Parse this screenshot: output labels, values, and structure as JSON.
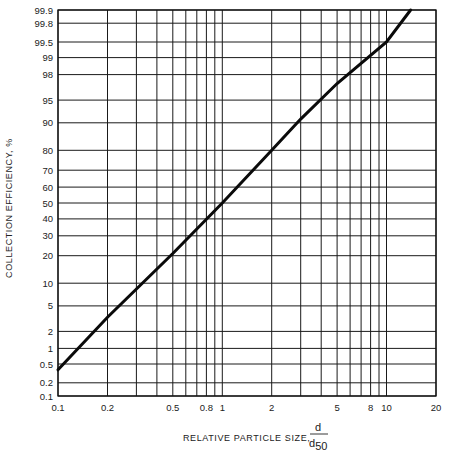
{
  "chart_data": {
    "type": "line",
    "title": "",
    "xlabel": "RELATIVE PARTICLE SIZE, d/d50",
    "xlabel_main": "RELATIVE PARTICLE SIZE,",
    "xlabel_frac_num": "d",
    "xlabel_frac_den": "d",
    "xlabel_frac_den_sub": "50",
    "ylabel": "COLLECTION EFFICIENCY, %",
    "x_scale": "log",
    "y_scale": "probability",
    "xlim": [
      0.1,
      20
    ],
    "ylim": [
      0.1,
      99.9
    ],
    "grid": true,
    "legend": null,
    "x_ticks": [
      0.1,
      0.2,
      0.3,
      0.4,
      0.5,
      0.6,
      0.7,
      0.8,
      0.9,
      1,
      2,
      3,
      4,
      5,
      6,
      7,
      8,
      9,
      10,
      20
    ],
    "x_tick_labels": [
      {
        "value": 0.1,
        "label": "0.1"
      },
      {
        "value": 0.2,
        "label": "0.2"
      },
      {
        "value": 0.5,
        "label": "0.5"
      },
      {
        "value": 0.8,
        "label": "0.8"
      },
      {
        "value": 1,
        "label": "1"
      },
      {
        "value": 2,
        "label": "2"
      },
      {
        "value": 5,
        "label": "5"
      },
      {
        "value": 8,
        "label": "8"
      },
      {
        "value": 10,
        "label": "10"
      },
      {
        "value": 20,
        "label": "20"
      }
    ],
    "y_ticks": [
      {
        "value": 0.1,
        "label": "0.1"
      },
      {
        "value": 0.2,
        "label": "0.2"
      },
      {
        "value": 0.5,
        "label": "0.5"
      },
      {
        "value": 1,
        "label": "1"
      },
      {
        "value": 2,
        "label": "2"
      },
      {
        "value": 5,
        "label": "5"
      },
      {
        "value": 10,
        "label": "10"
      },
      {
        "value": 20,
        "label": "20"
      },
      {
        "value": 30,
        "label": "30"
      },
      {
        "value": 40,
        "label": "40"
      },
      {
        "value": 50,
        "label": "50"
      },
      {
        "value": 60,
        "label": "60"
      },
      {
        "value": 70,
        "label": "70"
      },
      {
        "value": 80,
        "label": "80"
      },
      {
        "value": 90,
        "label": "90"
      },
      {
        "value": 95,
        "label": "95"
      },
      {
        "value": 98,
        "label": "98"
      },
      {
        "value": 99,
        "label": "99"
      },
      {
        "value": 99.5,
        "label": "99.5"
      },
      {
        "value": 99.8,
        "label": "99.8"
      },
      {
        "value": 99.9,
        "label": "99.9"
      }
    ],
    "series": [
      {
        "name": "Collection efficiency",
        "x": [
          0.1,
          0.2,
          0.5,
          1,
          2,
          3,
          5,
          10,
          14
        ],
        "y": [
          0.38,
          3.4,
          21,
          50,
          80,
          91,
          97.2,
          99.5,
          99.9
        ]
      }
    ]
  }
}
